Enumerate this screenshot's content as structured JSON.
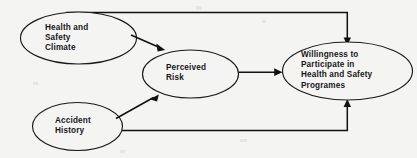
{
  "diagram": {
    "type": "path-model",
    "background_color": "#f4f4f2",
    "line_color": "#111111",
    "text_color": "#17171a",
    "nodes": [
      {
        "id": "health-safety-climate",
        "label": "Health and\nSafety\nClimate",
        "shape": "ellipse",
        "cx": 78.5,
        "cy": 38,
        "rx": 58,
        "ry": 26,
        "label_x": 45,
        "label_y": 23
      },
      {
        "id": "accident-history",
        "label": "Accident\nHistory",
        "shape": "ellipse",
        "cx": 77.5,
        "cy": 126.5,
        "rx": 45,
        "ry": 24,
        "label_x": 55,
        "label_y": 116
      },
      {
        "id": "perceived-risk",
        "label": "Perceived\nRisk",
        "shape": "ellipse",
        "cx": 190.5,
        "cy": 74,
        "rx": 48,
        "ry": 24,
        "label_x": 166,
        "label_y": 63
      },
      {
        "id": "willingness-to-participate",
        "label": "Willingness to\nParticipate in\nHealth and Safety\nProgrames",
        "shape": "ellipse",
        "cx": 347.5,
        "cy": 71,
        "rx": 65,
        "ry": 29,
        "label_x": 301,
        "label_y": 50
      }
    ],
    "edges": [
      {
        "id": "climate-to-risk",
        "from": "health-safety-climate",
        "to": "perceived-risk",
        "kind": "diagonal-arrow"
      },
      {
        "id": "climate-to-willingness",
        "from": "health-safety-climate",
        "to": "willingness-to-participate",
        "kind": "orthogonal-top-arrow"
      },
      {
        "id": "accident-to-risk",
        "from": "accident-history",
        "to": "perceived-risk",
        "kind": "diagonal-arrow"
      },
      {
        "id": "accident-to-willingness",
        "from": "accident-history",
        "to": "willingness-to-participate",
        "kind": "orthogonal-bottom-arrow"
      },
      {
        "id": "risk-to-willingness",
        "from": "perceived-risk",
        "to": "willingness-to-participate",
        "kind": "horizontal-arrow"
      }
    ]
  }
}
